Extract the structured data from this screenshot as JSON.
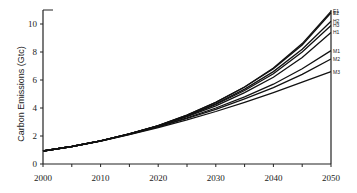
{
  "chart_data": {
    "type": "line",
    "title": "",
    "xlabel": "",
    "ylabel": "Carbon Emissions (Gtc)",
    "xlim": [
      2000,
      2050
    ],
    "ylim": [
      0,
      11
    ],
    "xticks": [
      2000,
      2010,
      2020,
      2030,
      2040,
      2050
    ],
    "yticks": [
      0,
      2,
      4,
      6,
      8,
      10
    ],
    "grid": false,
    "legend_position": "inline-right",
    "x": [
      2000,
      2005,
      2010,
      2015,
      2020,
      2025,
      2030,
      2035,
      2040,
      2045,
      2050
    ],
    "series": [
      {
        "name": "E1",
        "values": [
          0.93,
          1.25,
          1.65,
          2.15,
          2.75,
          3.5,
          4.4,
          5.5,
          6.85,
          8.6,
          10.9
        ]
      },
      {
        "name": "E2",
        "values": [
          0.93,
          1.25,
          1.65,
          2.15,
          2.75,
          3.5,
          4.4,
          5.5,
          6.8,
          8.5,
          10.8
        ]
      },
      {
        "name": "H2",
        "values": [
          0.93,
          1.25,
          1.65,
          2.15,
          2.73,
          3.45,
          4.3,
          5.35,
          6.6,
          8.2,
          10.2
        ]
      },
      {
        "name": "H3",
        "values": [
          0.93,
          1.25,
          1.65,
          2.15,
          2.72,
          3.42,
          4.25,
          5.25,
          6.45,
          8.0,
          9.9
        ]
      },
      {
        "name": "H1",
        "values": [
          0.93,
          1.25,
          1.65,
          2.15,
          2.7,
          3.38,
          4.15,
          5.1,
          6.2,
          7.6,
          9.4
        ]
      },
      {
        "name": "M1",
        "values": [
          0.93,
          1.25,
          1.65,
          2.14,
          2.68,
          3.3,
          4.0,
          4.8,
          5.7,
          6.8,
          8.1
        ]
      },
      {
        "name": "M2",
        "values": [
          0.93,
          1.25,
          1.64,
          2.12,
          2.65,
          3.25,
          3.9,
          4.65,
          5.45,
          6.4,
          7.5
        ]
      },
      {
        "name": "M3",
        "values": [
          0.93,
          1.25,
          1.63,
          2.1,
          2.6,
          3.15,
          3.75,
          4.4,
          5.1,
          5.85,
          6.6
        ]
      }
    ]
  }
}
